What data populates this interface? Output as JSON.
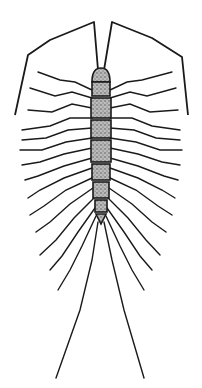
{
  "image": {
    "subject": "house centipede illustration",
    "style": "black ink line drawing with stippled body segments",
    "colors": {
      "background": "#ffffff",
      "ink": "#1a1a1a",
      "stipple": "#777777"
    },
    "body_segments": 8,
    "leg_pairs": 15
  }
}
